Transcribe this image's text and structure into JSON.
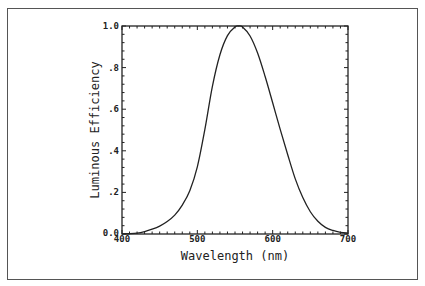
{
  "chart_data": {
    "type": "line",
    "title": "",
    "xlabel": "Wavelength (nm)",
    "ylabel": "Luminous Efficiency",
    "xlim": [
      400,
      700
    ],
    "ylim": [
      0.0,
      1.0
    ],
    "x_ticks": [
      400,
      500,
      600,
      700
    ],
    "x_tick_labels": [
      "400",
      "500",
      "600",
      "700"
    ],
    "y_ticks": [
      0.0,
      0.2,
      0.4,
      0.6,
      0.8,
      1.0
    ],
    "y_tick_labels": [
      "0.0",
      ".2",
      ".4",
      ".6",
      ".8",
      "1.0"
    ],
    "grid": false,
    "legend": null,
    "series": [
      {
        "name": "Photopic luminous efficiency",
        "x": [
          400,
          410,
          420,
          430,
          440,
          450,
          460,
          470,
          480,
          490,
          500,
          510,
          520,
          530,
          540,
          550,
          555,
          560,
          570,
          580,
          590,
          600,
          610,
          620,
          630,
          640,
          650,
          660,
          670,
          680,
          690,
          700
        ],
        "values": [
          0.0004,
          0.0012,
          0.004,
          0.0116,
          0.023,
          0.038,
          0.06,
          0.091,
          0.139,
          0.208,
          0.323,
          0.503,
          0.71,
          0.862,
          0.954,
          0.995,
          1.0,
          0.995,
          0.952,
          0.87,
          0.757,
          0.631,
          0.503,
          0.381,
          0.265,
          0.175,
          0.107,
          0.061,
          0.032,
          0.017,
          0.0082,
          0.0041
        ]
      }
    ]
  },
  "labels": {
    "xlabel": "Wavelength (nm)",
    "ylabel": "Luminous Efficiency",
    "x_ticks": [
      "400",
      "500",
      "600",
      "700"
    ],
    "y_ticks": [
      "0.0",
      ".2",
      ".4",
      ".6",
      ".8",
      "1.0"
    ]
  }
}
